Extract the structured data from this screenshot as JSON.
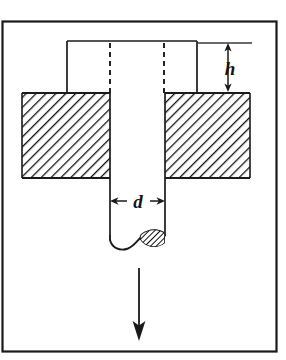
{
  "figure": {
    "background_color": "#ffffff",
    "line_color": "#1a1a1a",
    "hatch_color": "#111111",
    "border": {
      "name": "figure-border",
      "x": 2.5,
      "y": 21.5,
      "width": 274,
      "height": 330,
      "stroke_width": 2.2
    },
    "punch_head": {
      "label": "punch head",
      "left": 67,
      "right": 197,
      "top": 41,
      "bottom": 93,
      "stroke_width": 1.6
    },
    "hidden_edges": {
      "label": "hidden shaft edges",
      "x_positions": [
        110,
        164
      ],
      "top": 43,
      "bottom": 93,
      "dash_pattern": "5,4",
      "stroke_width": 1.8
    },
    "die_plate": {
      "label": "die plate",
      "top": 93,
      "bottom": 178,
      "left_block": {
        "left": 22,
        "right": 110
      },
      "right_block": {
        "left": 165,
        "right": 250
      },
      "hatch_angle_deg": 45,
      "hatch_spacing": 7,
      "hatch_stroke_width": 2.4
    },
    "punch_shaft": {
      "label": "punch shaft",
      "left": 110,
      "right": 165,
      "top": 93,
      "bottom": 243,
      "stroke_width": 1.6
    },
    "slug_tip": {
      "label": "fractured slug tip",
      "hatch_angle_deg": 45,
      "hatch_spacing": 4,
      "fill": "#ffffff"
    },
    "dimension_h": {
      "symbol": "h",
      "meaning": "punch penetration height",
      "arrow_x": 228,
      "arrow_top": 43,
      "arrow_bottom": 92,
      "extension_line": {
        "x1": 197,
        "x2": 252,
        "y": 43
      },
      "label_x": 230,
      "label_y": 74,
      "font_size": 19
    },
    "dimension_d": {
      "symbol": "d",
      "meaning": "punch diameter",
      "arrow_y": 201,
      "arrow_left": 110,
      "arrow_right": 165,
      "label_x": 138,
      "label_y": 208,
      "font_size": 19
    },
    "force_arrow": {
      "label": "applied punch force direction",
      "x": 139,
      "y_top": 268,
      "y_bottom": 340,
      "stroke_width": 1.8,
      "head_width": 11,
      "head_length": 18
    }
  }
}
